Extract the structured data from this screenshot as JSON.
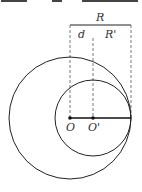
{
  "diagram": {
    "labels": {
      "R": "R",
      "d": "d",
      "R_prime": "R'",
      "O": "O",
      "O_prime": "O'"
    },
    "colors": {
      "stroke": "#222222",
      "dash": "#555555",
      "text": "#333333"
    },
    "shapes": {
      "big_circle": {
        "cx": 70,
        "cy": 118,
        "r": 61
      },
      "small_circle": {
        "cx": 93,
        "cy": 118,
        "r": 38
      },
      "segment_OT": {
        "x1": 70,
        "y1": 118,
        "x2": 131,
        "y2": 118
      },
      "top_bar": {
        "x1": 70,
        "y1": 25,
        "x2": 131,
        "y2": 25
      }
    }
  }
}
